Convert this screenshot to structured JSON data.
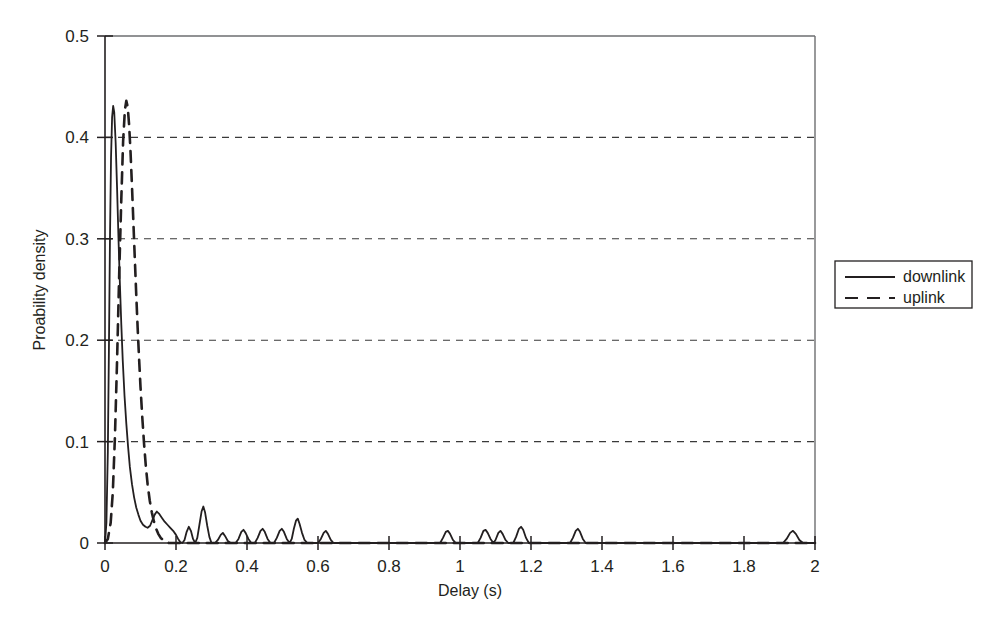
{
  "chart_data": {
    "type": "line",
    "title": "",
    "xlabel": "Delay (s)",
    "ylabel": "Proability density",
    "xlim": [
      0,
      2
    ],
    "ylim": [
      0,
      0.5
    ],
    "xticks": [
      "0",
      "0.2",
      "0.4",
      "0.6",
      "0.8",
      "1",
      "1.2",
      "1.4",
      "1.6",
      "1.8",
      "2"
    ],
    "xtick_values": [
      0,
      0.2,
      0.4,
      0.6,
      0.8,
      1.0,
      1.2,
      1.4,
      1.6,
      1.8,
      2.0
    ],
    "yticks": [
      "0",
      "0.1",
      "0.2",
      "0.3",
      "0.4",
      "0.5"
    ],
    "ytick_values": [
      0,
      0.1,
      0.2,
      0.3,
      0.4,
      0.5
    ],
    "grid": "horizontal-dashed",
    "gridlines_y": [
      0.1,
      0.2,
      0.3,
      0.4
    ],
    "legend_position": "right-outside",
    "line_color": "#231f20",
    "series": [
      {
        "name": "downlink",
        "style": "solid",
        "points": [
          [
            0.0,
            0.0
          ],
          [
            0.004,
            0.02
          ],
          [
            0.008,
            0.09
          ],
          [
            0.011,
            0.19
          ],
          [
            0.014,
            0.3
          ],
          [
            0.017,
            0.38
          ],
          [
            0.02,
            0.42
          ],
          [
            0.023,
            0.431
          ],
          [
            0.026,
            0.425
          ],
          [
            0.03,
            0.395
          ],
          [
            0.034,
            0.35
          ],
          [
            0.038,
            0.3
          ],
          [
            0.042,
            0.255
          ],
          [
            0.046,
            0.215
          ],
          [
            0.05,
            0.18
          ],
          [
            0.055,
            0.145
          ],
          [
            0.06,
            0.118
          ],
          [
            0.065,
            0.095
          ],
          [
            0.07,
            0.075
          ],
          [
            0.076,
            0.058
          ],
          [
            0.082,
            0.045
          ],
          [
            0.088,
            0.035
          ],
          [
            0.094,
            0.028
          ],
          [
            0.1,
            0.022
          ],
          [
            0.107,
            0.018
          ],
          [
            0.114,
            0.016
          ],
          [
            0.12,
            0.015
          ],
          [
            0.127,
            0.017
          ],
          [
            0.133,
            0.022
          ],
          [
            0.14,
            0.028
          ],
          [
            0.146,
            0.031
          ],
          [
            0.152,
            0.029
          ],
          [
            0.16,
            0.025
          ],
          [
            0.168,
            0.021
          ],
          [
            0.176,
            0.018
          ],
          [
            0.184,
            0.015
          ],
          [
            0.192,
            0.012
          ],
          [
            0.2,
            0.008
          ],
          [
            0.206,
            0.004
          ],
          [
            0.212,
            0.001
          ],
          [
            0.218,
            0.0
          ],
          [
            0.224,
            0.003
          ],
          [
            0.23,
            0.011
          ],
          [
            0.236,
            0.016
          ],
          [
            0.242,
            0.012
          ],
          [
            0.248,
            0.004
          ],
          [
            0.254,
            0.0
          ],
          [
            0.26,
            0.005
          ],
          [
            0.266,
            0.018
          ],
          [
            0.272,
            0.031
          ],
          [
            0.277,
            0.036
          ],
          [
            0.282,
            0.03
          ],
          [
            0.288,
            0.017
          ],
          [
            0.294,
            0.006
          ],
          [
            0.3,
            0.0
          ],
          [
            0.31,
            0.0
          ],
          [
            0.318,
            0.003
          ],
          [
            0.326,
            0.008
          ],
          [
            0.332,
            0.01
          ],
          [
            0.338,
            0.007
          ],
          [
            0.346,
            0.002
          ],
          [
            0.354,
            0.0
          ],
          [
            0.368,
            0.0
          ],
          [
            0.376,
            0.004
          ],
          [
            0.384,
            0.011
          ],
          [
            0.39,
            0.013
          ],
          [
            0.396,
            0.01
          ],
          [
            0.404,
            0.004
          ],
          [
            0.412,
            0.0
          ],
          [
            0.422,
            0.0
          ],
          [
            0.43,
            0.005
          ],
          [
            0.438,
            0.012
          ],
          [
            0.444,
            0.014
          ],
          [
            0.45,
            0.011
          ],
          [
            0.458,
            0.004
          ],
          [
            0.466,
            0.0
          ],
          [
            0.476,
            0.0
          ],
          [
            0.484,
            0.005
          ],
          [
            0.492,
            0.012
          ],
          [
            0.498,
            0.014
          ],
          [
            0.504,
            0.011
          ],
          [
            0.512,
            0.004
          ],
          [
            0.52,
            0.0
          ],
          [
            0.526,
            0.004
          ],
          [
            0.532,
            0.014
          ],
          [
            0.538,
            0.022
          ],
          [
            0.543,
            0.024
          ],
          [
            0.548,
            0.019
          ],
          [
            0.555,
            0.01
          ],
          [
            0.562,
            0.003
          ],
          [
            0.57,
            0.0
          ],
          [
            0.6,
            0.0
          ],
          [
            0.608,
            0.004
          ],
          [
            0.616,
            0.01
          ],
          [
            0.622,
            0.012
          ],
          [
            0.628,
            0.009
          ],
          [
            0.636,
            0.003
          ],
          [
            0.644,
            0.0
          ],
          [
            0.7,
            0.0
          ],
          [
            0.8,
            0.0
          ],
          [
            0.9,
            0.0
          ],
          [
            0.944,
            0.0
          ],
          [
            0.952,
            0.005
          ],
          [
            0.96,
            0.011
          ],
          [
            0.966,
            0.012
          ],
          [
            0.972,
            0.009
          ],
          [
            0.98,
            0.003
          ],
          [
            0.988,
            0.0
          ],
          [
            1.05,
            0.0
          ],
          [
            1.058,
            0.005
          ],
          [
            1.066,
            0.012
          ],
          [
            1.072,
            0.013
          ],
          [
            1.078,
            0.01
          ],
          [
            1.086,
            0.004
          ],
          [
            1.094,
            0.0
          ],
          [
            1.1,
            0.003
          ],
          [
            1.108,
            0.01
          ],
          [
            1.114,
            0.012
          ],
          [
            1.12,
            0.009
          ],
          [
            1.128,
            0.003
          ],
          [
            1.136,
            0.0
          ],
          [
            1.15,
            0.0
          ],
          [
            1.158,
            0.006
          ],
          [
            1.166,
            0.014
          ],
          [
            1.172,
            0.016
          ],
          [
            1.178,
            0.013
          ],
          [
            1.186,
            0.005
          ],
          [
            1.194,
            0.0
          ],
          [
            1.25,
            0.0
          ],
          [
            1.3,
            0.0
          ],
          [
            1.31,
            0.0
          ],
          [
            1.318,
            0.005
          ],
          [
            1.326,
            0.012
          ],
          [
            1.332,
            0.014
          ],
          [
            1.338,
            0.011
          ],
          [
            1.346,
            0.004
          ],
          [
            1.354,
            0.0
          ],
          [
            1.45,
            0.0
          ],
          [
            1.55,
            0.0
          ],
          [
            1.65,
            0.0
          ],
          [
            1.75,
            0.0
          ],
          [
            1.85,
            0.0
          ],
          [
            1.91,
            0.0
          ],
          [
            1.92,
            0.004
          ],
          [
            1.93,
            0.01
          ],
          [
            1.938,
            0.012
          ],
          [
            1.946,
            0.009
          ],
          [
            1.956,
            0.003
          ],
          [
            1.966,
            0.0
          ],
          [
            2.0,
            0.0
          ]
        ]
      },
      {
        "name": "uplink",
        "style": "dashed",
        "points": [
          [
            0.0,
            0.0
          ],
          [
            0.008,
            0.004
          ],
          [
            0.016,
            0.02
          ],
          [
            0.022,
            0.05
          ],
          [
            0.028,
            0.105
          ],
          [
            0.034,
            0.18
          ],
          [
            0.04,
            0.265
          ],
          [
            0.046,
            0.34
          ],
          [
            0.051,
            0.396
          ],
          [
            0.056,
            0.427
          ],
          [
            0.06,
            0.436
          ],
          [
            0.064,
            0.43
          ],
          [
            0.068,
            0.412
          ],
          [
            0.072,
            0.385
          ],
          [
            0.076,
            0.352
          ],
          [
            0.08,
            0.316
          ],
          [
            0.084,
            0.28
          ],
          [
            0.088,
            0.245
          ],
          [
            0.092,
            0.212
          ],
          [
            0.096,
            0.182
          ],
          [
            0.1,
            0.154
          ],
          [
            0.105,
            0.124
          ],
          [
            0.11,
            0.098
          ],
          [
            0.115,
            0.076
          ],
          [
            0.12,
            0.058
          ],
          [
            0.126,
            0.042
          ],
          [
            0.132,
            0.03
          ],
          [
            0.138,
            0.021
          ],
          [
            0.144,
            0.014
          ],
          [
            0.15,
            0.009
          ],
          [
            0.157,
            0.005
          ],
          [
            0.164,
            0.003
          ],
          [
            0.172,
            0.001
          ],
          [
            0.18,
            0.0
          ],
          [
            0.2,
            0.0
          ],
          [
            0.4,
            0.0
          ],
          [
            0.8,
            0.0
          ],
          [
            1.2,
            0.0
          ],
          [
            1.6,
            0.0
          ],
          [
            2.0,
            0.0
          ]
        ]
      }
    ],
    "legend": [
      {
        "label": "downlink",
        "style": "solid"
      },
      {
        "label": "uplink",
        "style": "dashed"
      }
    ]
  }
}
